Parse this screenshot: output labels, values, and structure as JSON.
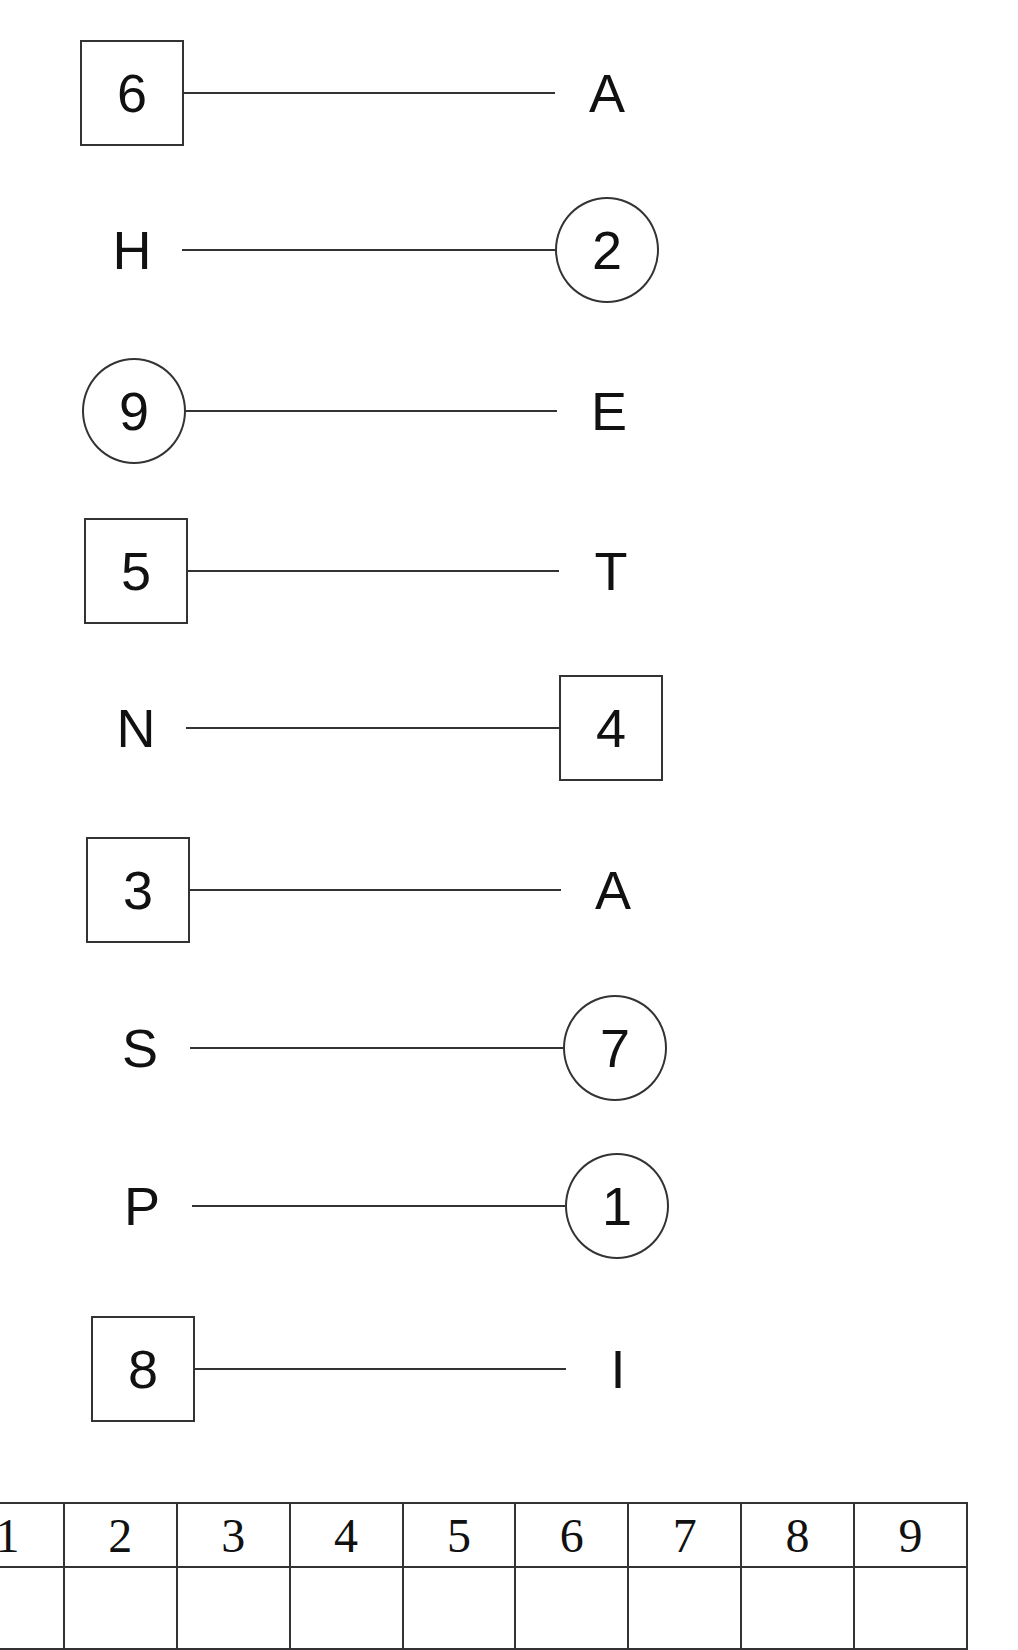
{
  "rows": [
    {
      "left": "6",
      "left_shape": "box",
      "right": "A",
      "right_shape": "plain",
      "y": 40,
      "lx": 80,
      "rx": 555
    },
    {
      "left": "H",
      "left_shape": "plain",
      "right": "2",
      "right_shape": "circle",
      "y": 197,
      "lx": 80,
      "rx": 555
    },
    {
      "left": "9",
      "left_shape": "circle",
      "right": "E",
      "right_shape": "plain",
      "y": 358,
      "lx": 82,
      "rx": 557
    },
    {
      "left": "5",
      "left_shape": "box",
      "right": "T",
      "right_shape": "plain",
      "y": 518,
      "lx": 84,
      "rx": 559
    },
    {
      "left": "N",
      "left_shape": "plain",
      "right": "4",
      "right_shape": "box",
      "y": 675,
      "lx": 84,
      "rx": 559
    },
    {
      "left": "3",
      "left_shape": "box",
      "right": "A",
      "right_shape": "plain",
      "y": 837,
      "lx": 86,
      "rx": 561
    },
    {
      "left": "S",
      "left_shape": "plain",
      "right": "7",
      "right_shape": "circle",
      "y": 995,
      "lx": 88,
      "rx": 563
    },
    {
      "left": "P",
      "left_shape": "plain",
      "right": "1",
      "right_shape": "circle",
      "y": 1153,
      "lx": 90,
      "rx": 565
    },
    {
      "left": "8",
      "left_shape": "box",
      "right": "I",
      "right_shape": "plain",
      "y": 1316,
      "lx": 91,
      "rx": 566
    }
  ],
  "grid": {
    "header": [
      "2",
      "3",
      "4",
      "5",
      "6",
      "7",
      "8",
      "9"
    ]
  }
}
